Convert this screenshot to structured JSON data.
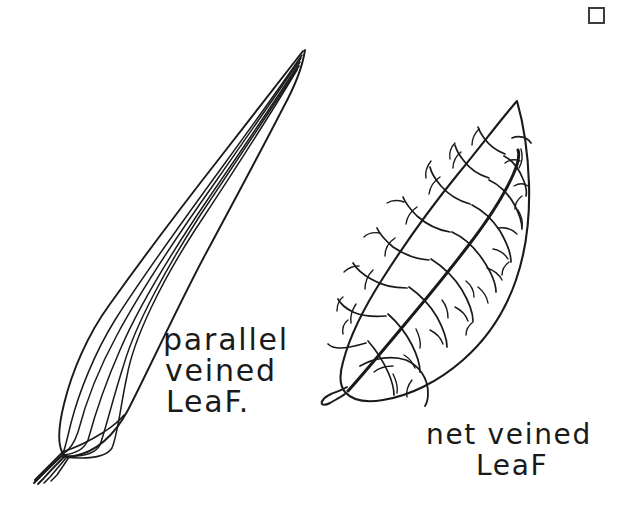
{
  "page": {
    "background_color": "#ffffff",
    "ink_color": "#1a1a1a",
    "width": 642,
    "height": 513
  },
  "labels": {
    "parallel": {
      "line1": "parallel",
      "line2": "veined",
      "line3": "LeaF."
    },
    "net": {
      "line1": "net veined",
      "line2": "LeaF"
    }
  },
  "figures": [
    {
      "name": "parallel-veined-leaf",
      "caption": "parallel veined LeaF.",
      "description": "long narrow lanceolate leaf with about seven parallel veins converging at base and tip, short stem tail at lower left",
      "vein_count": 7,
      "vein_pattern": "parallel",
      "tip": [
        305,
        50
      ],
      "base": [
        62,
        452
      ],
      "stem_end": [
        36,
        478
      ]
    },
    {
      "name": "net-veined-leaf",
      "caption": "net veined LeaF",
      "description": "broad ovate leaf with a thick diagonal midrib and branching reticulate secondary and tertiary veins",
      "vein_pattern": "reticulate",
      "tip": [
        517,
        101
      ],
      "base": [
        348,
        391
      ],
      "stem_end": [
        327,
        401
      ]
    }
  ],
  "icons": {
    "corner_square": {
      "name": "square-outline-icon",
      "color": "#3c3c3c",
      "x": 588,
      "y": 7,
      "size": 17
    }
  }
}
